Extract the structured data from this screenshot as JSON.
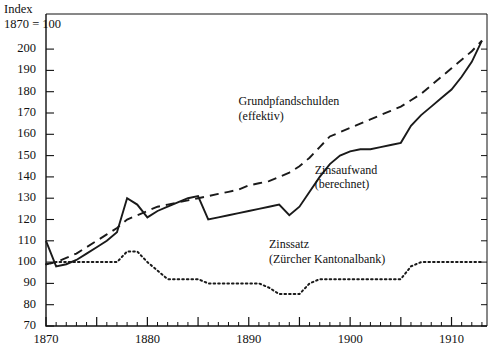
{
  "chart_data": {
    "type": "line",
    "title": "",
    "subtitle": "",
    "xlabel": "",
    "ylabel": "Index 1870 = 100",
    "ylabel_line1": "Index",
    "ylabel_line2": "1870 = 100",
    "xlim": [
      1869,
      1913.5
    ],
    "ylim": [
      70,
      207
    ],
    "ytick_labels": [
      "200",
      "190",
      "180",
      "170",
      "160",
      "150",
      "140",
      "130",
      "120",
      "110",
      "100",
      "90",
      "80",
      "70"
    ],
    "ytick_values": [
      200,
      190,
      180,
      170,
      160,
      150,
      140,
      130,
      120,
      110,
      100,
      90,
      80,
      70
    ],
    "xtick_labels": [
      "1870",
      "1880",
      "1890",
      "1900",
      "1910"
    ],
    "xtick_values": [
      1870,
      1880,
      1890,
      1900,
      1910
    ],
    "minor_xtick_step": 1,
    "major_xtick_step": 5,
    "grid": false,
    "legend_position": "inline-annotations",
    "series": [
      {
        "name": "Grundpfandschulden (effektiv)",
        "label_line1": "Grundpfandschulden",
        "label_line2": "(effektiv)",
        "style": "dashed",
        "color": "#1a1a1a",
        "x": [
          1870,
          1871,
          1872,
          1873,
          1874,
          1875,
          1876,
          1877,
          1878,
          1879,
          1880,
          1881,
          1882,
          1883,
          1884,
          1885,
          1886,
          1887,
          1888,
          1889,
          1890,
          1891,
          1892,
          1893,
          1894,
          1895,
          1896,
          1897,
          1898,
          1899,
          1900,
          1901,
          1902,
          1903,
          1904,
          1905,
          1906,
          1907,
          1908,
          1909,
          1910,
          1911,
          1912,
          1913
        ],
        "y": [
          99,
          100,
          102,
          104,
          107,
          110,
          113,
          116,
          120,
          122,
          124,
          126,
          127,
          128,
          129,
          130,
          131,
          132,
          133,
          134,
          136,
          137,
          138,
          140,
          142,
          145,
          149,
          154,
          159,
          161,
          163,
          165,
          167,
          169,
          171,
          173,
          176,
          179,
          183,
          187,
          191,
          195,
          199,
          204
        ]
      },
      {
        "name": "Zinsaufwand (berechnet)",
        "label_line1": "Zinsaufwand",
        "label_line2": "(berechnet)",
        "style": "solid",
        "color": "#1a1a1a",
        "x": [
          1870,
          1871,
          1872,
          1873,
          1874,
          1875,
          1876,
          1877,
          1878,
          1879,
          1880,
          1881,
          1882,
          1883,
          1884,
          1885,
          1886,
          1887,
          1888,
          1889,
          1890,
          1891,
          1892,
          1893,
          1894,
          1895,
          1896,
          1897,
          1898,
          1899,
          1900,
          1901,
          1902,
          1903,
          1904,
          1905,
          1906,
          1907,
          1908,
          1909,
          1910,
          1911,
          1912,
          1913
        ],
        "y": [
          110,
          98,
          99,
          101,
          104,
          107,
          110,
          114,
          130,
          127,
          121,
          124,
          126,
          128,
          130,
          131,
          120,
          121,
          122,
          123,
          124,
          125,
          126,
          127,
          122,
          126,
          133,
          140,
          146,
          150,
          152,
          153,
          153,
          154,
          155,
          156,
          164,
          169,
          173,
          177,
          181,
          187,
          194,
          204
        ]
      },
      {
        "name": "Zinssatz (Zürcher Kantonalbank)",
        "label_line1": "Zinssatz",
        "label_line2": "(Zürcher Kantonalbank)",
        "style": "dotted",
        "color": "#1a1a1a",
        "x": [
          1870,
          1871,
          1872,
          1873,
          1874,
          1875,
          1876,
          1877,
          1878,
          1879,
          1880,
          1881,
          1882,
          1883,
          1884,
          1885,
          1886,
          1887,
          1888,
          1889,
          1890,
          1891,
          1892,
          1893,
          1894,
          1895,
          1896,
          1897,
          1898,
          1899,
          1900,
          1901,
          1902,
          1903,
          1904,
          1905,
          1906,
          1907,
          1908,
          1909,
          1910,
          1911,
          1912,
          1913
        ],
        "y": [
          99,
          100,
          100,
          100,
          100,
          100,
          100,
          100,
          105,
          105,
          100,
          96,
          92,
          92,
          92,
          92,
          90,
          90,
          90,
          90,
          90,
          90,
          88,
          85,
          85,
          85,
          90,
          92,
          92,
          92,
          92,
          92,
          92,
          92,
          92,
          92,
          98,
          100,
          100,
          100,
          100,
          100,
          100,
          100
        ]
      }
    ],
    "annotations": [
      {
        "text": "Grundpfandschulden",
        "x": 1889.0,
        "y": 175
      },
      {
        "text": "(effektiv)",
        "x": 1889.0,
        "y": 168
      },
      {
        "text": "Zinsaufwand",
        "x": 1896.5,
        "y": 143
      },
      {
        "text": "(berechnet)",
        "x": 1896.5,
        "y": 136
      },
      {
        "text": "Zinssatz",
        "x": 1892.0,
        "y": 108
      },
      {
        "text": "(Zürcher Kantonalbank)",
        "x": 1892.0,
        "y": 101
      }
    ]
  },
  "axis": {
    "ylabel_line1": "Index",
    "ylabel_line2": "1870 = 100"
  }
}
